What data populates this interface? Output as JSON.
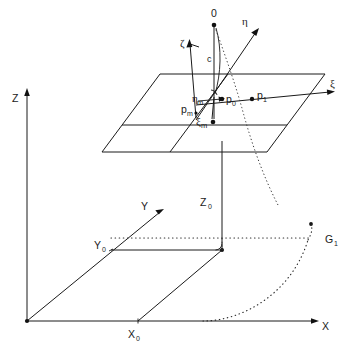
{
  "figure": {
    "background_color": "#ffffff",
    "line_color": "#1a1a1a",
    "dot_color": "#111111"
  },
  "world_frame": {
    "axes": [
      {
        "id": "z-axis",
        "label": "Z"
      },
      {
        "id": "y-axis",
        "label": "Y"
      },
      {
        "id": "x-axis",
        "label": "X"
      }
    ],
    "origin_label": "",
    "coordinates": [
      {
        "id": "x0",
        "label": "X",
        "subscript": "0"
      },
      {
        "id": "y0",
        "label": "Y",
        "subscript": "0"
      },
      {
        "id": "z0",
        "label": "Z",
        "subscript": "0"
      }
    ]
  },
  "image_frame": {
    "axes": [
      {
        "id": "zeta-axis",
        "label": "ζ"
      },
      {
        "id": "eta-axis",
        "label": "η"
      },
      {
        "id": "xi-axis",
        "label": "ξ"
      }
    ],
    "projection_center": {
      "id": "O",
      "label": "0"
    },
    "focal_length": {
      "id": "c",
      "label": "c"
    },
    "points": [
      {
        "id": "p0",
        "label": "p",
        "subscript": "0"
      },
      {
        "id": "p1",
        "label": "p",
        "subscript": "1"
      },
      {
        "id": "pm",
        "label": "p",
        "subscript": "m"
      }
    ],
    "offsets": [
      {
        "id": "xi-m",
        "label": "ξ",
        "subscript": "m"
      },
      {
        "id": "eta-m",
        "label": "η",
        "subscript": "m"
      }
    ]
  },
  "ground_curve": {
    "id": "G1",
    "label": "G",
    "subscript": "1"
  }
}
